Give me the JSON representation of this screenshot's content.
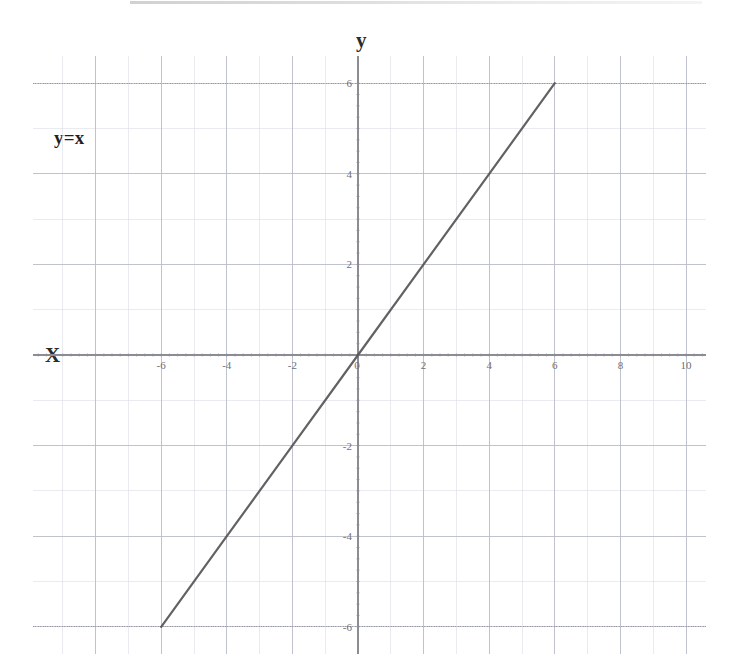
{
  "figure": {
    "background_color": "#ffffff",
    "scan_artifact": "top-edge-gray-bar"
  },
  "labels": {
    "y_axis_title": "y",
    "x_axis_title": "X",
    "equation": "y=x"
  },
  "colors": {
    "line": "#555555",
    "axis": "#8c8c96",
    "major_grid": "#b9bcc8",
    "minor_grid": "#dcdee6",
    "tick_text": "#6f6f7a",
    "title_text": "#2b2b2b"
  },
  "chart_data": {
    "type": "line",
    "title": "",
    "subtitle": "",
    "xlabel": "X",
    "ylabel": "y",
    "annotations": [
      {
        "text": "y=x",
        "x": -5.2,
        "y": 5.1
      }
    ],
    "grid": true,
    "grid_major_step_x": 2,
    "grid_major_step_y": 2,
    "grid_minor_step_x": 1,
    "grid_minor_step_y": 1,
    "legend": "none",
    "xlim": [
      -10,
      10.6
    ],
    "ylim": [
      -6.6,
      6.6
    ],
    "xticks": [
      -6,
      -4,
      -2,
      0,
      2,
      4,
      6,
      8,
      10
    ],
    "yticks": [
      6,
      4,
      2,
      0,
      -2,
      -4,
      -6
    ],
    "xtick_labels": [
      "-6",
      "-4",
      "-2",
      "0",
      "2",
      "4",
      "6",
      "8",
      "10"
    ],
    "ytick_labels": [
      "6",
      "4",
      "2",
      "0",
      "-2",
      "-4",
      "-6"
    ],
    "series": [
      {
        "name": "y=x",
        "equation": "y = x",
        "slope": 1,
        "intercept": 0,
        "color": "#555555",
        "x": [
          -6,
          -4,
          -2,
          0,
          2,
          4,
          6
        ],
        "values": [
          -6,
          -4,
          -2,
          0,
          2,
          4,
          6
        ]
      }
    ]
  }
}
